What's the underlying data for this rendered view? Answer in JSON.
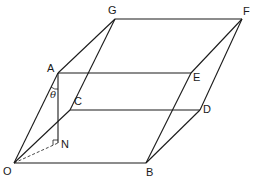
{
  "diagram": {
    "type": "geometry",
    "colors": {
      "line": "#1a1a1a",
      "background": "#ffffff"
    },
    "vertices": {
      "O": {
        "label": "O",
        "x": 14,
        "y": 163
      },
      "A": {
        "label": "A",
        "x": 58,
        "y": 73
      },
      "B": {
        "label": "B",
        "x": 146,
        "y": 163
      },
      "C": {
        "label": "C",
        "x": 70,
        "y": 110
      },
      "D": {
        "label": "D",
        "x": 200,
        "y": 110
      },
      "E": {
        "label": "E",
        "x": 191,
        "y": 73
      },
      "F": {
        "label": "F",
        "x": 242,
        "y": 19
      },
      "G": {
        "label": "G",
        "x": 115,
        "y": 19
      },
      "N": {
        "label": "N",
        "x": 58,
        "y": 143
      }
    },
    "angle_label": "θ",
    "right_angle_marker_at": "N",
    "edges": [
      [
        "O",
        "A"
      ],
      [
        "O",
        "B"
      ],
      [
        "O",
        "C"
      ],
      [
        "A",
        "E"
      ],
      [
        "A",
        "G"
      ],
      [
        "B",
        "E"
      ],
      [
        "B",
        "D"
      ],
      [
        "C",
        "D"
      ],
      [
        "C",
        "G"
      ],
      [
        "D",
        "F"
      ],
      [
        "E",
        "F"
      ],
      [
        "G",
        "F"
      ],
      [
        "A",
        "N"
      ]
    ],
    "dashed_edges": [
      [
        "O",
        "N"
      ]
    ]
  }
}
